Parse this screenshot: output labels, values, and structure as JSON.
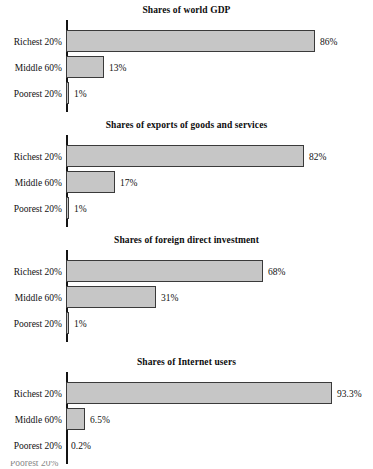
{
  "page": {
    "background_color": "#ffffff",
    "bar_fill_color": "#c6c6c6",
    "bar_stroke_color": "#3a3a3a",
    "axis_color": "#141414",
    "text_color": "#111111"
  },
  "chart_data": [
    {
      "type": "bar",
      "orientation": "horizontal",
      "title": "Shares of world GDP",
      "categories": [
        "Richest 20%",
        "Middle 60%",
        "Poorest 20%"
      ],
      "values": [
        86,
        13,
        1
      ],
      "value_labels": [
        "86%",
        "13%",
        "1%"
      ],
      "xlabel": "",
      "ylabel": "",
      "xlim": [
        0,
        100
      ],
      "grid": false,
      "legend": "none"
    },
    {
      "type": "bar",
      "orientation": "horizontal",
      "title": "Shares of exports of goods and services",
      "categories": [
        "Richest 20%",
        "Middle 60%",
        "Poorest 20%"
      ],
      "values": [
        82,
        17,
        1
      ],
      "value_labels": [
        "82%",
        "17%",
        "1%"
      ],
      "xlabel": "",
      "ylabel": "",
      "xlim": [
        0,
        100
      ],
      "grid": false,
      "legend": "none"
    },
    {
      "type": "bar",
      "orientation": "horizontal",
      "title": "Shares of foreign direct investment",
      "categories": [
        "Richest 20%",
        "Middle 60%",
        "Poorest 20%"
      ],
      "values": [
        68,
        31,
        1
      ],
      "value_labels": [
        "68%",
        "31%",
        "1%"
      ],
      "xlabel": "",
      "ylabel": "",
      "xlim": [
        0,
        100
      ],
      "grid": false,
      "legend": "none"
    },
    {
      "type": "bar",
      "orientation": "horizontal",
      "title": "Shares of Internet users",
      "categories": [
        "Richest 20%",
        "Middle 60%",
        "Poorest 20%"
      ],
      "values": [
        93.3,
        6.5,
        0.2
      ],
      "value_labels": [
        "93.3%",
        "6.5%",
        "0.2%"
      ],
      "xlabel": "",
      "ylabel": "",
      "xlim": [
        0,
        100
      ],
      "grid": false,
      "legend": "none"
    }
  ],
  "charts": [
    {
      "title": "Shares of world GDP",
      "rows": [
        {
          "label": "Richest 20%",
          "value_label": "86%",
          "bar_px": 249
        },
        {
          "label": "Middle 60%",
          "value_label": "13%",
          "bar_px": 38
        },
        {
          "label": "Poorest 20%",
          "value_label": "1%",
          "bar_px": 3
        }
      ]
    },
    {
      "title": "Shares of exports of goods and services",
      "rows": [
        {
          "label": "Richest 20%",
          "value_label": "82%",
          "bar_px": 238
        },
        {
          "label": "Middle 60%",
          "value_label": "17%",
          "bar_px": 49
        },
        {
          "label": "Poorest 20%",
          "value_label": "1%",
          "bar_px": 3
        }
      ]
    },
    {
      "title": "Shares of foreign direct investment",
      "rows": [
        {
          "label": "Richest 20%",
          "value_label": "68%",
          "bar_px": 197
        },
        {
          "label": "Middle 60%",
          "value_label": "31%",
          "bar_px": 90
        },
        {
          "label": "Poorest 20%",
          "value_label": "1%",
          "bar_px": 3
        }
      ]
    },
    {
      "title": "Shares of Internet users",
      "rows": [
        {
          "label": "Richest 20%",
          "value_label": "93.3%",
          "bar_px": 266
        },
        {
          "label": "Middle 60%",
          "value_label": "6.5%",
          "bar_px": 19
        },
        {
          "label": "Poorest 20%",
          "value_label": "0.2%",
          "bar_px": 0
        }
      ]
    }
  ],
  "footer": {
    "partial_text": "Poorest 20%"
  }
}
